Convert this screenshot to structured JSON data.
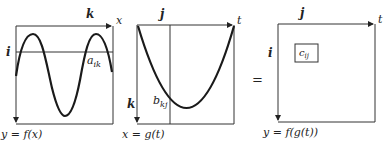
{
  "panels": [
    {
      "id": "f",
      "top_axis_label": "k",
      "top_axis_end_label": "x",
      "left_axis_label": "i",
      "element_label": "a",
      "element_subscript": "ik",
      "caption": "y = f(x)"
    },
    {
      "id": "g",
      "top_axis_label": "j",
      "top_axis_end_label": "t",
      "left_axis_label": "k",
      "element_label": "b",
      "element_subscript": "kj",
      "caption": "x = g(t)"
    },
    {
      "id": "fg",
      "top_axis_label": "j",
      "top_axis_end_label": "t",
      "left_axis_label": "i",
      "element_label": "c",
      "element_subscript": "ij",
      "caption": "y = f(g(t))"
    }
  ],
  "equals_sign": "="
}
